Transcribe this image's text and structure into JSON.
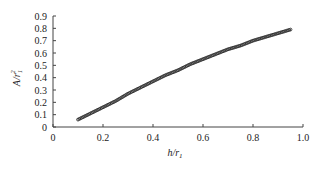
{
  "chart_data": {
    "type": "scatter",
    "title": "",
    "xlabel": "h/r₁",
    "ylabel": "A/r₁²",
    "xlim": [
      0,
      1.0
    ],
    "ylim": [
      0,
      0.9
    ],
    "grid": false,
    "legend": null,
    "x_ticks": [
      "0",
      "0.2",
      "0.4",
      "0.6",
      "0.8",
      "1.0"
    ],
    "y_ticks": [
      "0",
      "0.1",
      "0.2",
      "0.3",
      "0.4",
      "0.5",
      "0.6",
      "0.7",
      "0.8",
      "0.9"
    ],
    "series": [
      {
        "name": "A/r1^2 vs h/r1",
        "marker": "small dots (dense)",
        "color": "#333333",
        "x": [
          0.1,
          0.15,
          0.2,
          0.25,
          0.3,
          0.35,
          0.4,
          0.45,
          0.5,
          0.55,
          0.6,
          0.65,
          0.7,
          0.75,
          0.8,
          0.85,
          0.9,
          0.95
        ],
        "y": [
          0.06,
          0.11,
          0.16,
          0.21,
          0.27,
          0.32,
          0.37,
          0.42,
          0.46,
          0.51,
          0.55,
          0.59,
          0.63,
          0.66,
          0.7,
          0.73,
          0.76,
          0.79
        ]
      }
    ]
  },
  "axes": {
    "x_title_main": "h/r",
    "x_title_sub": "1",
    "y_title_main": "A/r",
    "y_title_sub": "1",
    "y_title_sup": "2"
  }
}
